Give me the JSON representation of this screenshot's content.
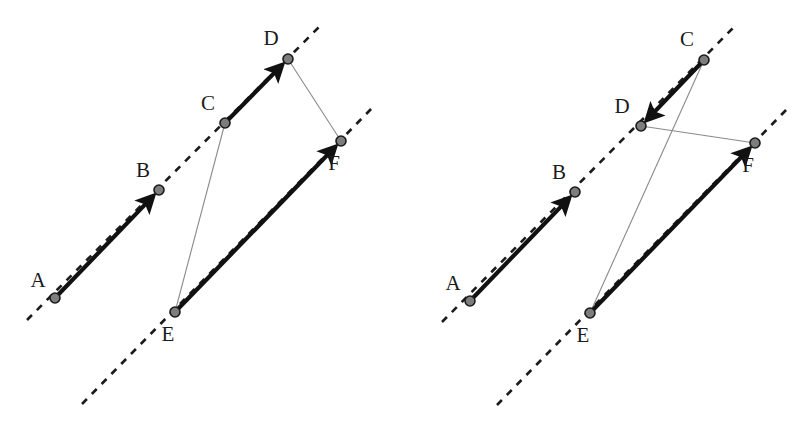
{
  "figure": {
    "background_color": "#ffffff",
    "width": 806,
    "height": 434,
    "styles": {
      "thick_vector_color": "#111111",
      "thick_vector_width": 4.2,
      "thin_line_color": "#8a8a8a",
      "thin_line_width": 1.1,
      "dashed_line_color": "#1b1b1b",
      "dashed_line_width": 2.6,
      "dash_pattern": "7,7",
      "point_fill": "#7d7d7d",
      "point_stroke": "#1a1a1a",
      "point_radius": 5.0,
      "label_color": "#1a1a1a",
      "label_font_size": 21
    }
  },
  "panels": [
    {
      "id": "left-panel",
      "name": "left-diagram",
      "points": [
        {
          "id": "A",
          "label": "A",
          "x": 55,
          "y": 298,
          "label_x": 38,
          "label_y": 287
        },
        {
          "id": "B",
          "label": "B",
          "x": 159,
          "y": 190,
          "label_x": 143,
          "label_y": 177
        },
        {
          "id": "C",
          "label": "C",
          "x": 225,
          "y": 123,
          "label_x": 208,
          "label_y": 110
        },
        {
          "id": "D",
          "label": "D",
          "x": 288,
          "y": 59,
          "label_x": 271,
          "label_y": 45
        },
        {
          "id": "E",
          "label": "E",
          "x": 175,
          "y": 312,
          "label_x": 168,
          "label_y": 341
        },
        {
          "id": "F",
          "label": "F",
          "x": 341,
          "y": 141,
          "label_x": 334,
          "label_y": 170
        }
      ],
      "dashed_lines": [
        {
          "id": "dashed-upper-left",
          "name": "dashed-line-through-A-B-C-D",
          "x1": 27,
          "y1": 320,
          "x2": 320,
          "y2": 26
        },
        {
          "id": "dashed-lower-left",
          "name": "dashed-line-through-E-F",
          "x1": 82,
          "y1": 404,
          "x2": 375,
          "y2": 105
        }
      ],
      "vectors": [
        {
          "id": "AB",
          "name": "vector-A-to-B",
          "from": "A",
          "to": "B",
          "style": "thick-arrow"
        },
        {
          "id": "CD",
          "name": "vector-C-to-D",
          "from": "C",
          "to": "D",
          "style": "thick-arrow"
        },
        {
          "id": "EF",
          "name": "vector-E-to-F",
          "from": "E",
          "to": "F",
          "style": "thick-arrow"
        }
      ],
      "thin_lines": [
        {
          "id": "EC",
          "name": "thin-line-E-to-C",
          "from": "E",
          "to": "C"
        },
        {
          "id": "DF",
          "name": "thin-line-D-to-F",
          "from": "D",
          "to": "F"
        }
      ]
    },
    {
      "id": "right-panel",
      "name": "right-diagram",
      "points": [
        {
          "id": "A",
          "label": "A",
          "x": 470,
          "y": 301,
          "label_x": 453,
          "label_y": 290
        },
        {
          "id": "B",
          "label": "B",
          "x": 575,
          "y": 192,
          "label_x": 559,
          "label_y": 179
        },
        {
          "id": "C",
          "label": "C",
          "x": 704,
          "y": 60,
          "label_x": 687,
          "label_y": 46
        },
        {
          "id": "D",
          "label": "D",
          "x": 641,
          "y": 126,
          "label_x": 622,
          "label_y": 113
        },
        {
          "id": "E",
          "label": "E",
          "x": 590,
          "y": 313,
          "label_x": 583,
          "label_y": 342
        },
        {
          "id": "F",
          "label": "F",
          "x": 755,
          "y": 143,
          "label_x": 748,
          "label_y": 172
        }
      ],
      "dashed_lines": [
        {
          "id": "dashed-upper-right",
          "name": "dashed-line-through-A-B-D-C",
          "x1": 442,
          "y1": 322,
          "x2": 733,
          "y2": 28
        },
        {
          "id": "dashed-lower-right",
          "name": "dashed-line-through-E-F",
          "x1": 497,
          "y1": 405,
          "x2": 789,
          "y2": 107
        }
      ],
      "vectors": [
        {
          "id": "AB",
          "name": "vector-A-to-B",
          "from": "A",
          "to": "B",
          "style": "thick-arrow"
        },
        {
          "id": "CD",
          "name": "vector-C-to-D",
          "from": "C",
          "to": "D",
          "style": "thick-arrow"
        },
        {
          "id": "EF",
          "name": "vector-E-to-F",
          "from": "E",
          "to": "F",
          "style": "thick-arrow"
        }
      ],
      "thin_lines": [
        {
          "id": "EC",
          "name": "thin-line-E-to-C",
          "from": "E",
          "to": "C"
        },
        {
          "id": "DF",
          "name": "thin-line-D-to-F",
          "from": "D",
          "to": "F"
        }
      ]
    }
  ]
}
